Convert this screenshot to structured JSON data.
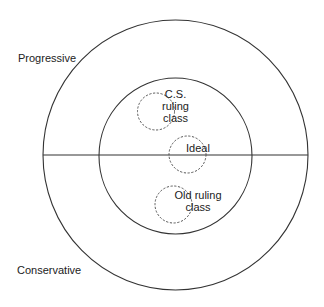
{
  "diagram": {
    "type": "concentric-circles",
    "axis_labels": {
      "top": "Progressive",
      "bottom": "Conservative"
    },
    "regions": [
      {
        "name": "C.S. ruling class",
        "lines": [
          "C.S.",
          "ruling",
          "class"
        ]
      },
      {
        "name": "Ideal",
        "lines": [
          "Ideal"
        ]
      },
      {
        "name": "Old ruling class",
        "lines": [
          "Old ruling",
          "class"
        ]
      }
    ],
    "colors": {
      "line": "#333333",
      "text": "#222222",
      "background": "#ffffff"
    }
  }
}
